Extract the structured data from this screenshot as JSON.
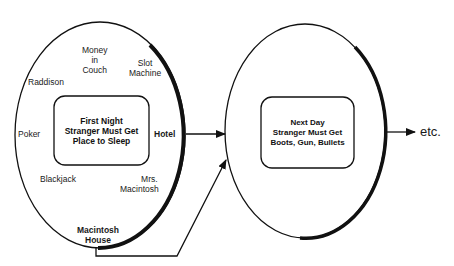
{
  "stage1": {
    "goal": [
      "First Night",
      "Stranger Must Get",
      "Place to Sleep"
    ],
    "options": {
      "money_in_couch": [
        "Money",
        "in",
        "Couch"
      ],
      "slot_machine": [
        "Slot",
        "Machine"
      ],
      "raddison": "Raddison",
      "poker": "Poker",
      "hotel": "Hotel",
      "blackjack": "Blackjack",
      "mrs_macintosh": [
        "Mrs.",
        "Macintosh"
      ],
      "macintosh_house": [
        "Macintosh",
        "House"
      ]
    }
  },
  "stage2": {
    "goal": [
      "Next Day",
      "Stranger Must Get",
      "Boots, Gun, Bullets"
    ]
  },
  "continuation": "etc.",
  "colors": {
    "stroke": "#111111",
    "background": "#ffffff"
  }
}
